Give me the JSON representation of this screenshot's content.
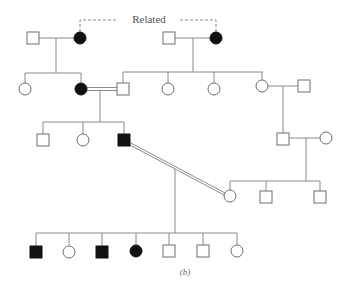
{
  "diagram": {
    "type": "pedigree",
    "related_label": "Related",
    "caption": "(b)",
    "legend": {
      "square": "male",
      "circle": "female",
      "filled": "affected",
      "double_line": "consanguineous mating",
      "dashed_line": "related individuals"
    },
    "colors": {
      "affected": "#111111",
      "unaffected": "#ffffff",
      "lines": "#8a8a8a"
    },
    "generations": [
      {
        "id": "I",
        "individuals": [
          {
            "id": "I-1",
            "sex": "male",
            "affected": false
          },
          {
            "id": "I-2",
            "sex": "female",
            "affected": true
          },
          {
            "id": "I-3",
            "sex": "male",
            "affected": false
          },
          {
            "id": "I-4",
            "sex": "female",
            "affected": true
          }
        ]
      },
      {
        "id": "II",
        "individuals": [
          {
            "id": "II-1",
            "sex": "female",
            "affected": false
          },
          {
            "id": "II-2",
            "sex": "female",
            "affected": true
          },
          {
            "id": "II-3",
            "sex": "male",
            "affected": false
          },
          {
            "id": "II-4",
            "sex": "female",
            "affected": false
          },
          {
            "id": "II-5",
            "sex": "female",
            "affected": false
          },
          {
            "id": "II-6",
            "sex": "female",
            "affected": false
          },
          {
            "id": "II-7",
            "sex": "male",
            "affected": false
          }
        ]
      },
      {
        "id": "III",
        "individuals": [
          {
            "id": "III-1",
            "sex": "male",
            "affected": false
          },
          {
            "id": "III-2",
            "sex": "female",
            "affected": false
          },
          {
            "id": "III-3",
            "sex": "male",
            "affected": true
          },
          {
            "id": "III-4",
            "sex": "male",
            "affected": false
          },
          {
            "id": "III-5",
            "sex": "female",
            "affected": false
          }
        ]
      },
      {
        "id": "IV",
        "individuals": [
          {
            "id": "IV-1",
            "sex": "female",
            "affected": false
          },
          {
            "id": "IV-2",
            "sex": "male",
            "affected": false
          },
          {
            "id": "IV-3",
            "sex": "male",
            "affected": false
          }
        ]
      },
      {
        "id": "V",
        "individuals": [
          {
            "id": "V-1",
            "sex": "male",
            "affected": true
          },
          {
            "id": "V-2",
            "sex": "female",
            "affected": false
          },
          {
            "id": "V-3",
            "sex": "male",
            "affected": true
          },
          {
            "id": "V-4",
            "sex": "female",
            "affected": true
          },
          {
            "id": "V-5",
            "sex": "male",
            "affected": false
          },
          {
            "id": "V-6",
            "sex": "male",
            "affected": false
          },
          {
            "id": "V-7",
            "sex": "female",
            "affected": false
          }
        ]
      }
    ]
  }
}
